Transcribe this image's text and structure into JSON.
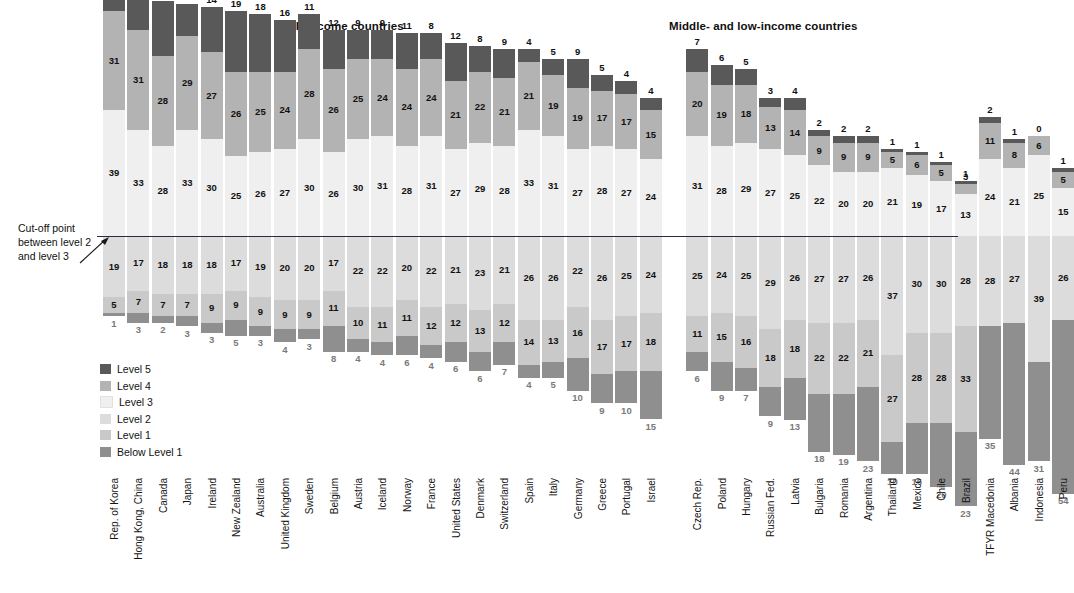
{
  "headings": {
    "high_income": "High-income countries",
    "middle_low_income": "Middle- and low-income countries"
  },
  "annotation": {
    "cutoff_text": "Cut-off point between level 2 and level 3",
    "cutoff_line1": "Cut-off point",
    "cutoff_line2": "between level 2",
    "cutoff_line3": "and level 3"
  },
  "legend": {
    "position": "below-left",
    "items": [
      {
        "label": "Level 5",
        "color": "#595959"
      },
      {
        "label": "Level 4",
        "color": "#b3b3b3"
      },
      {
        "label": "Level 3",
        "color": "#efefef"
      },
      {
        "label": "Level 2",
        "color": "#dcdcdc"
      },
      {
        "label": "Level 1",
        "color": "#c9c9c9"
      },
      {
        "label": "Below Level 1",
        "color": "#8f8f8f"
      }
    ]
  },
  "chart_data": {
    "type": "bar",
    "subtype": "stacked-100-percent-diverging",
    "title": "",
    "xlabel": "",
    "ylabel": "",
    "ylim": [
      0,
      100
    ],
    "grid": false,
    "cutoff_between": [
      "Level 2",
      "Level 3"
    ],
    "series": [
      {
        "name": "Level 5",
        "color": "#595959"
      },
      {
        "name": "Level 4",
        "color": "#b3b3b3"
      },
      {
        "name": "Level 3",
        "color": "#efefef"
      },
      {
        "name": "Level 2",
        "color": "#dcdcdc"
      },
      {
        "name": "Level 1",
        "color": "#c9c9c9"
      },
      {
        "name": "Below Level 1",
        "color": "#8f8f8f"
      }
    ],
    "groups": [
      {
        "name": "High-income countries",
        "categories": [
          "Rep. of Korea",
          "Hong Kong, China",
          "Canada",
          "Japan",
          "Ireland",
          "New Zealand",
          "Australia",
          "United Kingdom",
          "Sweden",
          "Belgium",
          "Austria",
          "Iceland",
          "Norway",
          "France",
          "United States",
          "Denmark",
          "Switzerland",
          "Spain",
          "Italy",
          "Germany",
          "Greece",
          "Portugal",
          "Israel"
        ],
        "values": [
          [
            6,
            31,
            39,
            19,
            5,
            1
          ],
          [
            10,
            31,
            33,
            17,
            7,
            3
          ],
          [
            17,
            28,
            28,
            18,
            7,
            2
          ],
          [
            10,
            29,
            33,
            18,
            7,
            3
          ],
          [
            14,
            27,
            30,
            18,
            9,
            3
          ],
          [
            19,
            26,
            25,
            17,
            9,
            5
          ],
          [
            18,
            25,
            26,
            19,
            9,
            3
          ],
          [
            16,
            24,
            27,
            20,
            9,
            4
          ],
          [
            11,
            28,
            30,
            20,
            9,
            3
          ],
          [
            12,
            26,
            26,
            17,
            11,
            8
          ],
          [
            9,
            25,
            30,
            22,
            10,
            4
          ],
          [
            9,
            24,
            31,
            22,
            11,
            4
          ],
          [
            11,
            24,
            28,
            20,
            11,
            6
          ],
          [
            8,
            24,
            31,
            22,
            12,
            4
          ],
          [
            12,
            21,
            27,
            21,
            12,
            6
          ],
          [
            8,
            22,
            29,
            23,
            13,
            6
          ],
          [
            9,
            21,
            28,
            21,
            12,
            7
          ],
          [
            4,
            21,
            33,
            26,
            14,
            4
          ],
          [
            5,
            19,
            31,
            26,
            13,
            5
          ],
          [
            9,
            19,
            27,
            22,
            16,
            10
          ],
          [
            5,
            17,
            28,
            26,
            17,
            9
          ],
          [
            4,
            17,
            27,
            25,
            17,
            10
          ],
          [
            4,
            15,
            24,
            24,
            18,
            15
          ]
        ]
      },
      {
        "name": "Middle- and low-income countries",
        "categories": [
          "Czech Rep.",
          "Poland",
          "Hungary",
          "Russian Fed.",
          "Latvia",
          "Bulgaria",
          "Romania",
          "Argentina",
          "Thailand",
          "Mexico",
          "Chile",
          "Brazil",
          "TFYR Macedonia",
          "Albania",
          "Indonesia",
          "Peru"
        ],
        "values": [
          [
            7,
            20,
            31,
            25,
            11,
            6
          ],
          [
            6,
            19,
            28,
            24,
            15,
            9
          ],
          [
            5,
            18,
            29,
            25,
            16,
            7
          ],
          [
            3,
            13,
            27,
            29,
            18,
            9
          ],
          [
            4,
            14,
            25,
            26,
            18,
            13
          ],
          [
            2,
            9,
            22,
            27,
            22,
            18
          ],
          [
            2,
            9,
            20,
            27,
            22,
            19
          ],
          [
            2,
            9,
            20,
            26,
            21,
            23
          ],
          [
            1,
            5,
            21,
            37,
            27,
            10
          ],
          [
            1,
            6,
            19,
            30,
            28,
            16
          ],
          [
            1,
            5,
            17,
            30,
            28,
            20
          ],
          [
            1,
            3,
            13,
            28,
            33,
            23
          ],
          [
            2,
            11,
            24,
            28,
            0,
            35
          ],
          [
            1,
            8,
            21,
            27,
            0,
            44
          ],
          [
            0,
            6,
            25,
            39,
            0,
            31
          ],
          [
            1,
            5,
            15,
            26,
            0,
            54
          ]
        ]
      }
    ]
  }
}
